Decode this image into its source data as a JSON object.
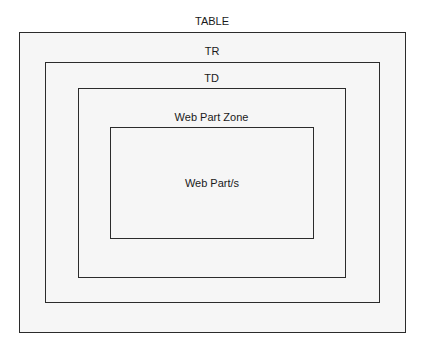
{
  "diagram": {
    "type": "nested-containers",
    "background": "#f6f6f6",
    "border_color": "#2b2b2b",
    "levels": [
      {
        "label": "TABLE"
      },
      {
        "label": "TR"
      },
      {
        "label": "TD"
      },
      {
        "label": "Web Part Zone"
      },
      {
        "label": "Web Part/s"
      }
    ]
  }
}
